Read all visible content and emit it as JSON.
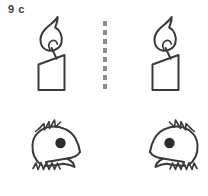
{
  "sheet": {
    "title": "Picture matching worksheet",
    "background_color": "#ffffff",
    "ink_color": "#3a3a3a",
    "divider_color": "#8d8d8d",
    "label_color": "#3d3d3d"
  },
  "rows": [
    {
      "number": "9",
      "letter": "c",
      "label": "9  c",
      "divider": "vertical-dotted-line",
      "left": {
        "picture": "candle",
        "alt": "Line drawing of a lit candle with flame",
        "orientation": "normal"
      },
      "right": {
        "picture": "candle",
        "alt": "Line drawing of a lit candle with flame",
        "orientation": "normal"
      }
    },
    {
      "number": "10",
      "letter": "c",
      "label": "10  c",
      "divider": "vertical-dotted-line",
      "left": {
        "picture": "cockatoo-head",
        "alt": "Line drawing of a cockatoo parrot head facing right",
        "orientation": "facing-right"
      },
      "right": {
        "picture": "cockatoo-head",
        "alt": "Line drawing of a cockatoo parrot head facing left",
        "orientation": "facing-left"
      }
    }
  ]
}
